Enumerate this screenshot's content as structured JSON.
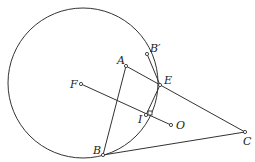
{
  "diagram": {
    "type": "geometry",
    "circle": {
      "cx": 83,
      "cy": 83,
      "r": 75
    },
    "points": {
      "B_prime": {
        "label": "B′",
        "x": 147,
        "y": 54,
        "lx": 150,
        "ly": 52
      },
      "A": {
        "label": "A",
        "x": 126,
        "y": 66,
        "lx": 117,
        "ly": 64
      },
      "E": {
        "label": "E",
        "x": 160,
        "y": 85,
        "lx": 164,
        "ly": 84
      },
      "F": {
        "label": "F",
        "x": 81,
        "y": 84,
        "lx": 70,
        "ly": 88
      },
      "I": {
        "label": "I",
        "x": 146,
        "y": 115,
        "lx": 138,
        "ly": 123
      },
      "O": {
        "label": "O",
        "x": 171,
        "y": 125,
        "lx": 176,
        "ly": 129
      },
      "B": {
        "label": "B",
        "x": 103,
        "y": 155,
        "lx": 93,
        "ly": 154
      },
      "C": {
        "label": "C",
        "x": 245,
        "y": 132,
        "lx": 243,
        "ly": 145
      }
    },
    "segments": [
      "A-B",
      "A-C",
      "B-C",
      "F-O",
      "B'-E",
      "E-I"
    ]
  }
}
